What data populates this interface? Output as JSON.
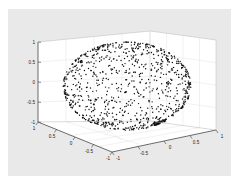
{
  "figure": {
    "background_color": "#e9e9e9",
    "axes_background_color": "#ffffff",
    "axis_line_color": "#3c3c3c",
    "grid_color": "#d9d9d9",
    "marker_color": "#101010"
  },
  "chart_data": {
    "type": "scatter",
    "title": "",
    "subtitle": "",
    "xlabel": "",
    "ylabel": "",
    "zlabel": "",
    "projection": "3d",
    "n_points": 900,
    "xlim": [
      -1,
      1
    ],
    "ylim": [
      -1,
      1
    ],
    "zlim": [
      -1,
      1
    ],
    "grid": true,
    "legend": null,
    "marker": "dot",
    "marker_size": 1.3,
    "view": {
      "azimuth": -37.5,
      "elevation": 30
    },
    "axes": {
      "z": {
        "name": "z-axis",
        "ticks": [
          1,
          0.5,
          0,
          -0.5,
          -1
        ],
        "tick_labels": [
          "1",
          "0.5",
          "0",
          "-0.5",
          "-1"
        ]
      },
      "x": {
        "name": "x-axis",
        "ticks": [
          1,
          0.5,
          0,
          -0.5,
          -1
        ],
        "tick_labels": [
          "1",
          "0.5",
          "0",
          "-0.5",
          "-1"
        ]
      },
      "y": {
        "name": "y-axis",
        "ticks": [
          -1,
          -0.5,
          0,
          0.5,
          1
        ],
        "tick_labels": [
          "-1",
          "-0.5",
          "0",
          "0.5",
          "1"
        ]
      }
    },
    "sphere": {
      "radius": 1.0,
      "center": [
        0,
        0,
        0
      ],
      "distribution": "uniform-on-surface"
    }
  }
}
